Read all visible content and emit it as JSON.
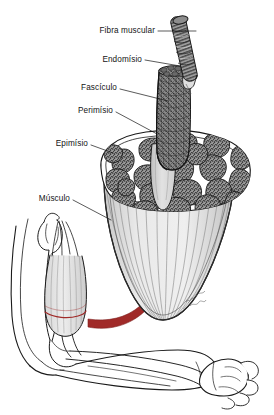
{
  "figure": {
    "language": "pt-BR",
    "background_color": "#ffffff",
    "ink_color": "#1a1a1a",
    "accent_color": "#a02a28",
    "fascicle_fill": "#8e8e8e",
    "sheath_fill": "#d9d9d9",
    "signature": "artist-signature"
  },
  "labels": [
    {
      "id": "fibra-muscular",
      "text": "Fibra muscular",
      "x": 155,
      "y": 33,
      "align": "right",
      "leader": {
        "x1": 158,
        "y1": 31,
        "x2": 196,
        "y2": 31
      },
      "points_to": "single-muscle-fiber"
    },
    {
      "id": "endomisio",
      "text": "Endomísio",
      "x": 142,
      "y": 62,
      "align": "right",
      "leader": {
        "x1": 145,
        "y1": 60,
        "x2": 178,
        "y2": 65
      },
      "points_to": "endomysium-sheath"
    },
    {
      "id": "fasciculo",
      "text": "Fascículo",
      "x": 117,
      "y": 90,
      "align": "right",
      "leader": {
        "x1": 120,
        "y1": 89,
        "x2": 167,
        "y2": 100
      },
      "points_to": "fascicle-bundle"
    },
    {
      "id": "perimisio",
      "text": "Perimísio",
      "x": 113,
      "y": 113,
      "align": "right",
      "leader": {
        "x1": 116,
        "y1": 112,
        "x2": 158,
        "y2": 133
      },
      "points_to": "perimysium-sheath"
    },
    {
      "id": "epimisio",
      "text": "Epimísio",
      "x": 88,
      "y": 146,
      "align": "right",
      "leader": {
        "x1": 91,
        "y1": 145,
        "x2": 112,
        "y2": 152
      },
      "points_to": "epimysium-rim"
    },
    {
      "id": "musculo",
      "text": "Músculo",
      "x": 70,
      "y": 201,
      "align": "right",
      "leader": {
        "x1": 73,
        "y1": 200,
        "x2": 110,
        "y2": 219
      },
      "points_to": "muscle-cross-section"
    }
  ],
  "structures": {
    "single_muscle_fiber": "striated cylindrical muscle fiber drawn above the fascicle",
    "fascicle_bundle": "cross-hatched cylindrical bundle of fibers wrapped in perimysium",
    "muscle_cross_section": "cut belly of muscle showing polygonal fascicles in cross section",
    "epimysium_rim": "outer connective tissue sheath around the whole muscle",
    "arm": "flexed arm with humerus, biceps brachii, radius, ulna and closed fist",
    "callout_arrow": "red curved arrow linking the biceps to the enlarged cross-section",
    "cut_band": "red cut line across the biceps belly"
  },
  "fascicle_count": 22
}
